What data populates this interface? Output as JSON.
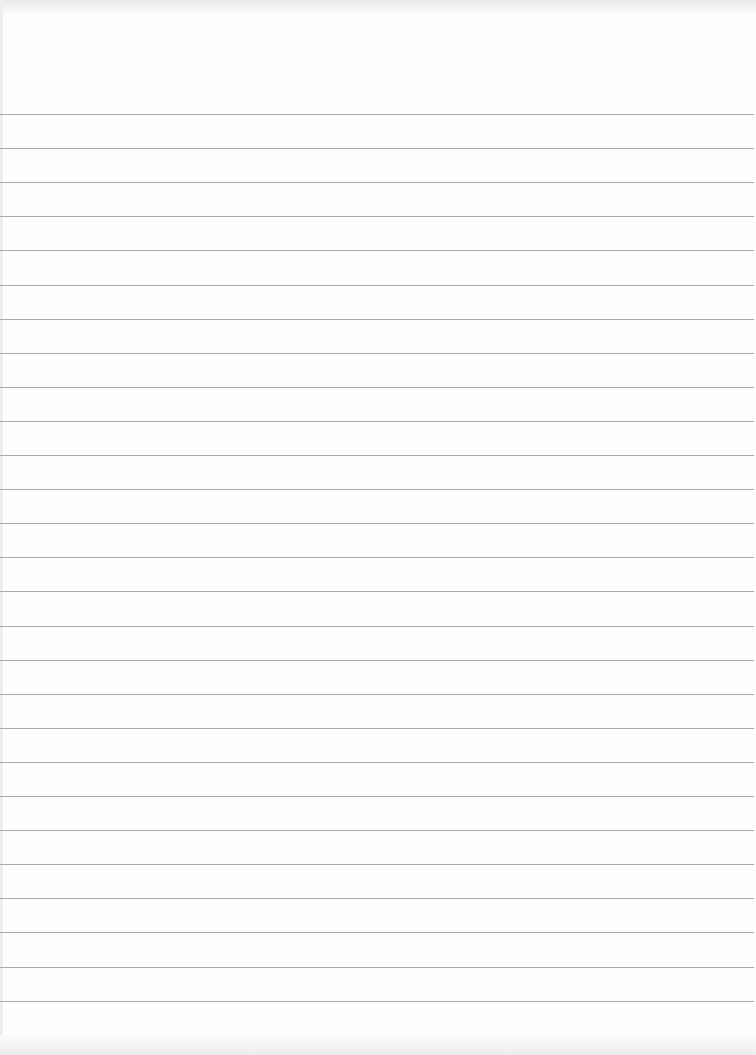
{
  "page": {
    "type": "blank ruled paper",
    "background_color": "#fdfdfd",
    "line_color": "#a9a9a9",
    "line_count": 27,
    "first_line_y": 114,
    "line_spacing": 34.1,
    "text": ""
  }
}
